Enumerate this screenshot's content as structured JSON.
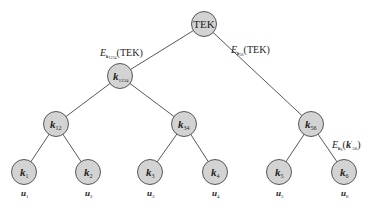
{
  "diagram": {
    "type": "key-tree",
    "root": {
      "id": "root",
      "label": "TEK",
      "x": 204,
      "y": 24
    },
    "nodes": [
      {
        "id": "k1234",
        "main": "k",
        "sub": "1234",
        "x": 120,
        "y": 76
      },
      {
        "id": "k12",
        "main": "k",
        "sub": "12",
        "x": 56,
        "y": 124
      },
      {
        "id": "k34",
        "main": "k",
        "sub": "34",
        "x": 184,
        "y": 124
      },
      {
        "id": "k56",
        "main": "k",
        "sub": "56",
        "x": 311,
        "y": 124
      },
      {
        "id": "k1",
        "main": "k",
        "sub": "1",
        "x": 24,
        "y": 172
      },
      {
        "id": "k2",
        "main": "k",
        "sub": "2",
        "x": 88,
        "y": 172
      },
      {
        "id": "k3",
        "main": "k",
        "sub": "3",
        "x": 150,
        "y": 172
      },
      {
        "id": "k4",
        "main": "k",
        "sub": "4",
        "x": 215,
        "y": 172
      },
      {
        "id": "k5",
        "main": "k",
        "sub": "5",
        "x": 279,
        "y": 172
      },
      {
        "id": "k6",
        "main": "k",
        "sub": "6",
        "x": 344,
        "y": 172
      }
    ],
    "users": [
      {
        "main": "u",
        "sub": "1"
      },
      {
        "main": "u",
        "sub": "2"
      },
      {
        "main": "u",
        "sub": "3"
      },
      {
        "main": "u",
        "sub": "4"
      },
      {
        "main": "u",
        "sub": "5"
      },
      {
        "main": "u",
        "sub": "6"
      }
    ],
    "edge_labels": {
      "left": {
        "main": "E",
        "sub": "k",
        "subsub": "1234",
        "arg": "(TEK)"
      },
      "right": {
        "main": "E",
        "sub": "k",
        "subsub": "56",
        "arg": "(TEK)"
      },
      "k56_k6": {
        "main": "E",
        "sub": "k",
        "subsub": "6",
        "arg_open": "(",
        "arg_main": "k",
        "arg_prime": "′",
        "arg_sub": "56",
        "arg_close": ")"
      }
    },
    "colors": {
      "node_fill": "#d3d3d3",
      "node_stroke": "#555555",
      "edge": "#444444"
    }
  }
}
